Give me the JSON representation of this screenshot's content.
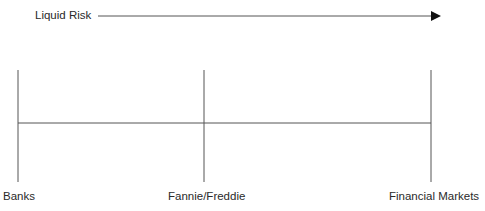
{
  "header": {
    "axis_label": "Liquid Risk",
    "direction": "increasing to the right"
  },
  "nodes": [
    {
      "label": "Banks",
      "x": 18
    },
    {
      "label": "Fannie/Freddie",
      "x": 204
    },
    {
      "label": "Financial Markets",
      "x": 431
    }
  ],
  "colors": {
    "line": "#555555",
    "arrowhead": "#111111",
    "text": "#2a2a2a"
  }
}
